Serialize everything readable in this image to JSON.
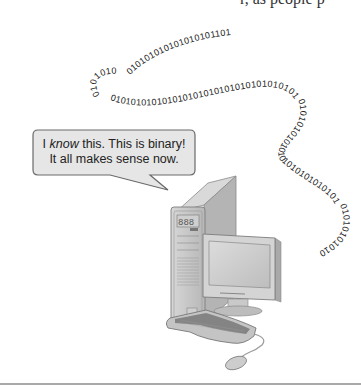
{
  "illustration": {
    "top_cut_text": "r, as people p",
    "speech_bubble": {
      "line1_prefix": "I ",
      "line1_emphasis": "know",
      "line1_suffix": " this. This is binary!",
      "line2": "It all makes sense now."
    },
    "binary_stream": {
      "segment_top": "0101010101010101011011",
      "segment_loop": "01010101010101010101010101010101010101010101",
      "segment_right": "0101010101010101010101010101",
      "segment_end": "01010101010"
    },
    "colors": {
      "bubble_fill": "#e6e6e6",
      "bubble_stroke": "#6a6a6a",
      "device_gray": "#c8c8c8",
      "rule": "#a9a9a9"
    }
  }
}
